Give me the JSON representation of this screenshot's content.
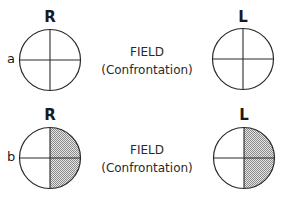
{
  "diagram": {
    "rows": [
      {
        "label": "a",
        "right_eye": {
          "label": "R",
          "shaded_quadrants": []
        },
        "left_eye": {
          "label": "L",
          "shaded_quadrants": []
        },
        "title": "FIELD",
        "subtitle": "(Confrontation)"
      },
      {
        "label": "b",
        "right_eye": {
          "label": "R",
          "shaded_quadrants": [
            "upper-right",
            "lower-right"
          ]
        },
        "left_eye": {
          "label": "L",
          "shaded_quadrants": [
            "upper-right",
            "lower-right"
          ]
        },
        "title": "FIELD",
        "subtitle": "(Confrontation)"
      }
    ],
    "colors": {
      "stroke": "#2a2a2a",
      "shade": "#9a9a9a",
      "background": "#ffffff"
    }
  }
}
